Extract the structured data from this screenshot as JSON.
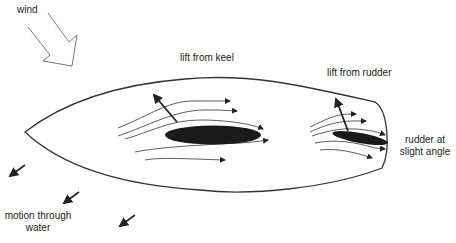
{
  "diagram": {
    "labels": {
      "wind": "wind",
      "lift_keel": "lift from keel",
      "lift_rudder": "lift from rudder",
      "rudder_line1": "rudder at",
      "rudder_line2": "slight angle",
      "motion_line1": "motion through",
      "motion_line2": "water"
    },
    "colors": {
      "line": "#333333",
      "foil": "#1a1a1a",
      "text": "#222222",
      "background": "#ffffff"
    },
    "elements": [
      {
        "id": "wind-arrow",
        "type": "hollow-arrow",
        "direction": "down-right"
      },
      {
        "id": "hull",
        "type": "outline",
        "shape": "boat-hull-top-view"
      },
      {
        "id": "keel",
        "type": "filled-ellipse"
      },
      {
        "id": "rudder",
        "type": "filled-ellipse",
        "angled": true
      },
      {
        "id": "keel-lift-arrow",
        "type": "arrow",
        "direction": "up-left"
      },
      {
        "id": "rudder-lift-arrow",
        "type": "arrow",
        "direction": "up-left"
      },
      {
        "id": "keel-flow-lines",
        "count": 6
      },
      {
        "id": "rudder-flow-lines",
        "count": 5
      },
      {
        "id": "motion-arrows",
        "count": 3,
        "direction": "down-left"
      }
    ]
  }
}
